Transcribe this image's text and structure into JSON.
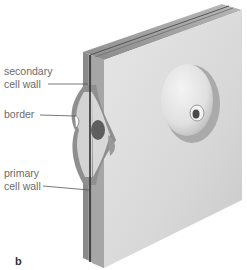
{
  "figure": {
    "panel_letter": "b",
    "labels": [
      {
        "id": "secondary-cell-wall",
        "line1": "secondary",
        "line2": "cell wall"
      },
      {
        "id": "border",
        "line1": "border"
      },
      {
        "id": "primary-cell-wall",
        "line1": "primary",
        "line2": "cell wall"
      }
    ],
    "colors": {
      "face": "#dcdcdc",
      "edge_light": "#a9a9a9",
      "edge_dark": "#6f6f6f",
      "middle_lamella": "#3a3a3a",
      "pit_rim": "#c4c4c4",
      "pit_aperture": "#555555",
      "leader_line": "#555555",
      "label_text": "#6b6b6b"
    }
  }
}
